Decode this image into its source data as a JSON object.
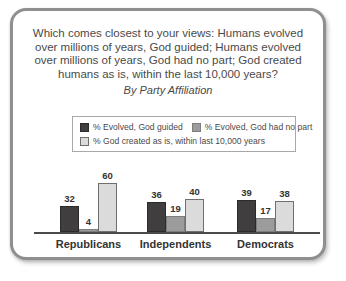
{
  "card": {
    "title_lines": [
      "Which comes closest to your views: Humans evolved",
      "over millions of years, God guided; Humans evolved",
      "over millions of years, God had no part; God created",
      "humans as is, within the last 10,000 years?"
    ],
    "subtitle": "By Party Affiliation"
  },
  "legend": {
    "items": [
      {
        "label": "% Evolved, God guided"
      },
      {
        "label": "% Evolved, God had no part"
      },
      {
        "label": "% God created as is, within last 10,000 years"
      }
    ]
  },
  "chart_data": {
    "type": "bar",
    "subtitle": "By Party Affiliation",
    "categories": [
      "Republicans",
      "Independents",
      "Democrats"
    ],
    "series": [
      {
        "name": "% Evolved, God guided",
        "values": [
          32,
          36,
          39
        ],
        "color": "#403e3e",
        "border": "#2b2b2b"
      },
      {
        "name": "% Evolved, God had no part",
        "values": [
          4,
          19,
          17
        ],
        "color": "#9c9c9c",
        "border": "#7d7d7d"
      },
      {
        "name": "% God created as is, within last 10,000 years",
        "values": [
          60,
          40,
          38
        ],
        "color": "#dbdbdb",
        "border": "#6f6f6f"
      }
    ],
    "ylim": [
      0,
      65
    ],
    "xlabel": "",
    "ylabel": "",
    "grid": false,
    "legend_position": "top",
    "value_labels": true
  },
  "colors": {
    "card_border": "#8f8f8f",
    "legend_border": "#a8a8a8",
    "axis": "#4a4a4a",
    "title_text": "#4a4a4a",
    "value_label_text": "#333333"
  }
}
